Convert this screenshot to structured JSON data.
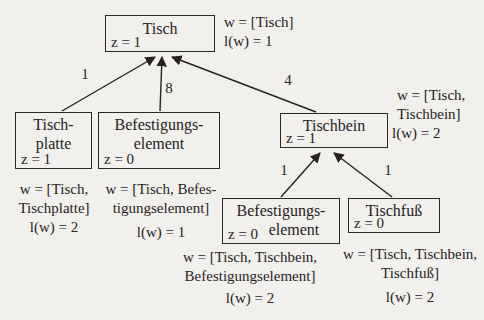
{
  "palette": {
    "paper": "#f2f0ec",
    "ink": "#26231f"
  },
  "nodes": {
    "tisch": {
      "title1": "Tisch",
      "z": "z = 1"
    },
    "tischplatte": {
      "title1": "Tisch-",
      "title2": "platte",
      "z": "z = 1"
    },
    "befestigung1": {
      "title1": "Befestigungs-",
      "title2": "element",
      "z": "z = 0"
    },
    "tischbein": {
      "title1": "Tischbein",
      "z": "z = 1"
    },
    "befestigung2": {
      "title1": "Befestigungs-",
      "title2": "element",
      "z": "z = 0"
    },
    "tischfuss": {
      "title1": "Tischfuß",
      "z": "z = 0"
    }
  },
  "edges": {
    "tisch_tischplatte": {
      "label": "1"
    },
    "tisch_befestigung": {
      "label": "8"
    },
    "tisch_tischbein": {
      "label": "4"
    },
    "tischbein_befestigung": {
      "label": "1"
    },
    "tischbein_tischfuss": {
      "label": "1"
    }
  },
  "annotations": {
    "tisch": {
      "line1": "w = [Tisch]",
      "line2": "l(w) = 1"
    },
    "tischbein": {
      "line1": "w = [Tisch,",
      "line2": "Tischbein]",
      "line3": "l(w) = 2"
    },
    "tischplatte": {
      "line1": "w = [Tisch,",
      "line2": "Tischplatte]",
      "line3": "l(w) = 2"
    },
    "befestigung1": {
      "line1": "w = [Tisch, Befes-",
      "line2": "tigungselement]",
      "line3": "l(w) = 1"
    },
    "befestigung2": {
      "line1": "w = [Tisch, Tischbein,",
      "line2": "Befestigungselement]",
      "line3": "l(w) = 2"
    },
    "tischfuss": {
      "line1": "w = [Tisch, Tischbein,",
      "line2": "Tischfuß]",
      "line3": "l(w) = 2"
    }
  }
}
